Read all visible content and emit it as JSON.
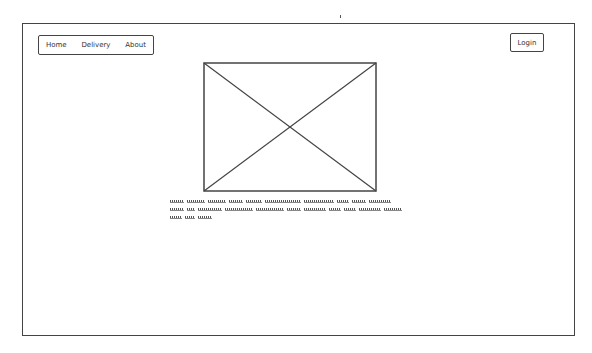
{
  "nav": {
    "items": [
      {
        "label": "Home"
      },
      {
        "label": "Delivery"
      },
      {
        "label": "About"
      }
    ]
  },
  "header": {
    "login_label": "Login"
  },
  "main": {
    "image_placeholder": "image-placeholder-icon",
    "caption_lines": [
      [
        14,
        18,
        18,
        14,
        16,
        36,
        30,
        12,
        14,
        22
      ],
      [
        14,
        8,
        24,
        28,
        28,
        14,
        22,
        12,
        12,
        22,
        18
      ],
      [
        12,
        10,
        14
      ]
    ]
  },
  "colors": {
    "stroke": "#444444",
    "background": "#ffffff"
  }
}
